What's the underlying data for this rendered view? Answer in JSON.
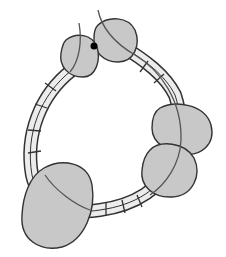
{
  "diagram": {
    "title": "",
    "colors": {
      "background": "#ffffff",
      "outline": "#333333",
      "ring_fill": "#ececec",
      "blob_fill": "#c8c8c8",
      "strand": "#555555",
      "dot": "#000000"
    },
    "ring": {
      "segments": "ladder-like double-track band with cross bars"
    },
    "blobs": [
      {
        "id": "blob-top-left",
        "cx": 80,
        "cy": 56,
        "rx": 20,
        "ry": 22
      },
      {
        "id": "blob-top-right",
        "cx": 115,
        "cy": 40,
        "rx": 22,
        "ry": 23
      },
      {
        "id": "blob-right-upper",
        "cx": 181,
        "cy": 129,
        "rx": 30,
        "ry": 26
      },
      {
        "id": "blob-right-lower",
        "cx": 169,
        "cy": 171,
        "rx": 28,
        "ry": 27
      },
      {
        "id": "blob-bottom-left",
        "cx": 56,
        "cy": 206,
        "rx": 36,
        "ry": 42
      }
    ],
    "dot": {
      "cx": 94,
      "cy": 46,
      "r": 3.5
    }
  }
}
